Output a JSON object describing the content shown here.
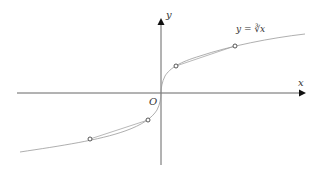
{
  "diagram": {
    "axes": {
      "x_label": "x",
      "y_label": "y",
      "origin_label": "O"
    },
    "curve": {
      "label": "y = ∛x",
      "function": "cube root"
    },
    "marked_points": [
      {
        "name": "P1",
        "quadrant": "I",
        "position": "near"
      },
      {
        "name": "P2",
        "quadrant": "I",
        "position": "far"
      },
      {
        "name": "P3",
        "quadrant": "III",
        "position": "near"
      },
      {
        "name": "P4",
        "quadrant": "III",
        "position": "far"
      }
    ],
    "secant_segments": [
      {
        "from": "P1",
        "to": "P2"
      },
      {
        "from": "P3",
        "to": "P4"
      }
    ],
    "colors": {
      "axis": "#555555",
      "curve": "#9a9a9a",
      "points": "#444444"
    }
  }
}
